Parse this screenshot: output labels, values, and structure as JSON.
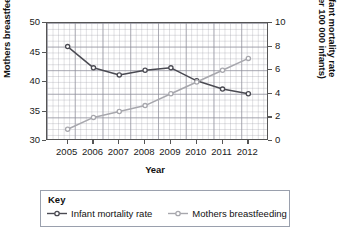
{
  "chart_data": {
    "type": "line",
    "title": "",
    "xlabel": "Year",
    "categories": [
      "2005",
      "2006",
      "2007",
      "2008",
      "2009",
      "2010",
      "2011",
      "2012"
    ],
    "grid": true,
    "legend_position": "bottom",
    "legend_title": "Key",
    "axes": {
      "left": {
        "label": "Mothers breastfeeding (%)",
        "ticks": [
          "50",
          "45",
          "40",
          "35",
          "30"
        ],
        "lim": [
          30,
          50
        ]
      },
      "right": {
        "label_line1": "Infant mortality rate",
        "label_line2": "(per 100 000 infants)",
        "ticks": [
          "10",
          "8",
          "6",
          "4",
          "2",
          "0"
        ],
        "lim": [
          0,
          10
        ]
      }
    },
    "series": [
      {
        "name": "Infant mortality rate",
        "axis": "right",
        "color": "#4a4a52",
        "marker": "open-circle",
        "values": [
          8.0,
          6.2,
          5.6,
          6.0,
          6.2,
          5.1,
          4.4,
          4.0
        ]
      },
      {
        "name": "Mothers breastfeeding",
        "axis": "left",
        "color": "#a7a7ad",
        "marker": "open-circle",
        "values": [
          32,
          34,
          35,
          36,
          38,
          40,
          42,
          44
        ]
      }
    ]
  }
}
